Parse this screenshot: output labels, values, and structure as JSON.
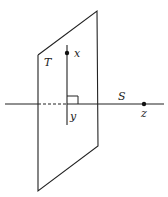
{
  "diagram": {
    "labels": {
      "plane": "T",
      "line": "S",
      "point_x": "x",
      "point_y": "y",
      "point_z": "z"
    },
    "colors": {
      "stroke": "#222222",
      "background": "#ffffff"
    }
  }
}
